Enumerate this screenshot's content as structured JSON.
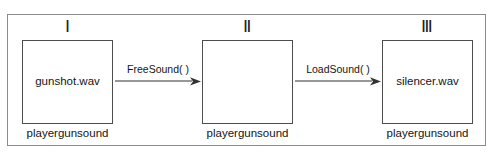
{
  "diagram": {
    "frame_color": "#8c8c8c",
    "box_border_color": "#4d4d4d",
    "text_color": "#151515",
    "background": "#ffffff",
    "stages": [
      {
        "numeral": "Ⅰ",
        "box_text": "gunshot.wav",
        "caption": "playergunsound"
      },
      {
        "numeral": "Ⅱ",
        "box_text": "",
        "caption": "playergunsound"
      },
      {
        "numeral": "Ⅲ",
        "box_text": "silencer.wav",
        "caption": "playergunsound"
      }
    ],
    "arrows": [
      {
        "label": "FreeSound( )"
      },
      {
        "label": "LoadSound( )"
      }
    ]
  }
}
